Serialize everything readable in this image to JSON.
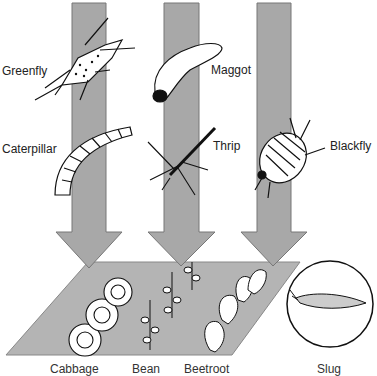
{
  "diagram": {
    "pests": [
      {
        "name": "Greenfly"
      },
      {
        "name": "Caterpillar"
      },
      {
        "name": "Maggot"
      },
      {
        "name": "Thrip"
      },
      {
        "name": "Blackfly"
      }
    ],
    "crops": [
      {
        "name": "Cabbage"
      },
      {
        "name": "Bean"
      },
      {
        "name": "Beetroot"
      }
    ],
    "inset": {
      "name": "Slug"
    },
    "colors": {
      "arrow": "#a8a8a8",
      "ground": "#b4b4b4",
      "line": "#1a1a1a"
    }
  }
}
